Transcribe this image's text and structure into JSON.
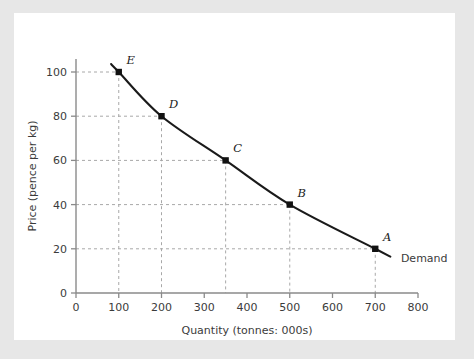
{
  "figure": {
    "background_color": "#e7e7e7",
    "card_color": "#ffffff",
    "axis_color": "#8a8a8a",
    "grid_color": "#a8a8a8",
    "curve_color": "#1a1a1a"
  },
  "chart_data": {
    "type": "line",
    "title": "",
    "xlabel": "Quantity (tonnes: 000s)",
    "ylabel": "Price (pence per kg)",
    "xlim": [
      0,
      800
    ],
    "ylim": [
      0,
      100
    ],
    "xticks": [
      0,
      100,
      200,
      300,
      400,
      500,
      600,
      700,
      800
    ],
    "xtick_labels": [
      "0",
      "100",
      "200",
      "300",
      "400",
      "500",
      "600",
      "700",
      "800"
    ],
    "yticks": [
      0,
      20,
      40,
      60,
      80,
      100
    ],
    "ytick_labels": [
      "0",
      "20",
      "40",
      "60",
      "80",
      "100"
    ],
    "grid": "dashed-guides-to-points",
    "legend": "inline-curve-label",
    "series": [
      {
        "name": "Demand",
        "label": "Demand",
        "x": [
          700,
          500,
          350,
          200,
          100
        ],
        "y": [
          20,
          40,
          60,
          80,
          100
        ],
        "point_labels": [
          "A",
          "B",
          "C",
          "D",
          "E"
        ]
      }
    ],
    "points": [
      {
        "label": "A",
        "x": 700,
        "y": 20
      },
      {
        "label": "B",
        "x": 500,
        "y": 40
      },
      {
        "label": "C",
        "x": 350,
        "y": 60
      },
      {
        "label": "D",
        "x": 200,
        "y": 80
      },
      {
        "label": "E",
        "x": 100,
        "y": 100
      }
    ],
    "annotations": [
      {
        "text": "Demand",
        "x": 760,
        "y": 14
      }
    ]
  }
}
